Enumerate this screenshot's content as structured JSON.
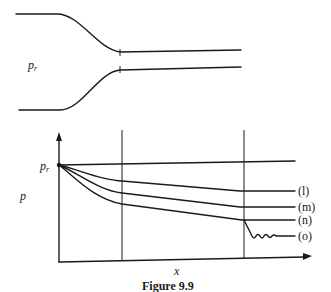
{
  "figure": {
    "caption": "Figure 9.9",
    "nozzle": {
      "reservoir_label_main": "p",
      "reservoir_label_sub": "r"
    },
    "plot": {
      "y_axis_label": "p",
      "x_axis_label": "x",
      "origin_label_main": "p",
      "origin_label_sub": "r",
      "curves": [
        {
          "id": "l",
          "label": "(l)"
        },
        {
          "id": "m",
          "label": "(m)"
        },
        {
          "id": "n",
          "label": "(n)"
        },
        {
          "id": "o",
          "label": "(o)"
        }
      ]
    }
  }
}
